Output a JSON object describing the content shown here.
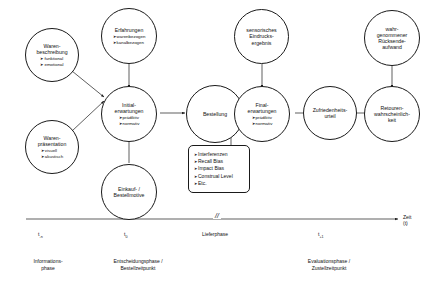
{
  "diagram": {
    "stroke_color": "#1a1a1a",
    "background_color": "#ffffff",
    "bullet_marker": "➤"
  },
  "nodes": {
    "warenbeschreibung": {
      "title_line1": "Waren-",
      "title_line2": "beschreibung",
      "bullets": [
        "funktional",
        "emotional"
      ]
    },
    "warenpraesentation": {
      "title_line1": "Waren-",
      "title_line2": "präsentation",
      "bullets": [
        "visuell",
        "akustisch"
      ]
    },
    "erfahrungen": {
      "title_line1": "Erfahrungen",
      "bullets": [
        "warenbezogen",
        "kanalbezogen"
      ]
    },
    "initialerwartungen": {
      "title_line1": "Initial-",
      "title_line2": "erwartungen",
      "bullets": [
        "prädiktiv",
        "normativ"
      ]
    },
    "einkaufmotive": {
      "title_line1": "Einkauf- /",
      "title_line2": "Bestellmotive",
      "bullets": []
    },
    "bestellung": {
      "title_line1": "Bestellung",
      "bullets": []
    },
    "sensorisches": {
      "title_line1": "sensorisches",
      "title_line2": "Eindrucks-",
      "title_line3": "ergebnis",
      "bullets": []
    },
    "finalerwartungen": {
      "title_line1": "Final-",
      "title_line2": "erwartungen",
      "bullets": [
        "prädiktiv",
        "normativ"
      ]
    },
    "zufriedenheit": {
      "title_line1": "Zufriedenheits-",
      "title_line2": "urteil",
      "bullets": []
    },
    "ruecksendeaufwand": {
      "title_line1": "wahr-",
      "title_line2": "genommener",
      "title_line3": "Rücksende-",
      "title_line4": "aufwand",
      "bullets": []
    },
    "retouren": {
      "title_line1": "Retouren-",
      "title_line2": "wahrscheinlich-",
      "title_line3": "keit",
      "bullets": []
    }
  },
  "bias_box": {
    "items": [
      "Interferenzen",
      "Recall Bias",
      "Impact Bias",
      "Construal Level",
      "Etc."
    ]
  },
  "timeline": {
    "axis_title_line1": "Zeit",
    "axis_title_line2": "(t)",
    "break_mark": "//",
    "ticks": [
      {
        "base": "t",
        "sub": "-n"
      },
      {
        "base": "t",
        "sub": "0"
      },
      {
        "base": "t",
        "sub": "+1"
      }
    ],
    "lieferphase_label": "Lieferphase",
    "phases": [
      {
        "line1": "Informations-",
        "line2": "phase"
      },
      {
        "line1": "Entscheidungsphase /",
        "line2": "Bestellzeitpunkt"
      },
      {
        "line1": "Evaluationsphase /",
        "line2": "Zustellzeitpunkt"
      }
    ]
  }
}
